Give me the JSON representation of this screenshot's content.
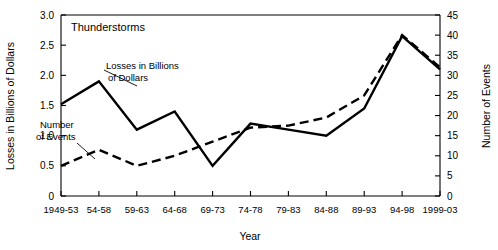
{
  "chart_data": {
    "type": "line",
    "title": "Thunderstorms",
    "xlabel": "Year",
    "ylabel": "Losses in Billions of Dollars",
    "y2label": "Number of Events",
    "categories": [
      "1949-53",
      "54-58",
      "59-63",
      "64-68",
      "69-73",
      "74-78",
      "79-83",
      "84-88",
      "89-93",
      "94-98",
      "1999-03"
    ],
    "ylim": [
      0,
      3.0
    ],
    "y2lim": [
      0,
      45
    ],
    "yticks": [
      "0",
      "0.5",
      "1.0",
      "1.5",
      "2.0",
      "2.5",
      "3.0"
    ],
    "ytick_values": [
      0,
      0.5,
      1.0,
      1.5,
      2.0,
      2.5,
      3.0
    ],
    "y2ticks": [
      "0",
      "5",
      "10",
      "15",
      "20",
      "25",
      "30",
      "35",
      "40",
      "45"
    ],
    "y2tick_values": [
      0,
      5,
      10,
      15,
      20,
      25,
      30,
      35,
      40,
      45
    ],
    "grid": false,
    "legend": "annotations",
    "series": [
      {
        "name": "Losses in Billions of Dollars",
        "axis": "left",
        "style": "solid",
        "values": [
          1.52,
          1.9,
          1.1,
          1.4,
          0.5,
          1.2,
          1.1,
          1.0,
          1.45,
          2.65,
          2.1
        ]
      },
      {
        "name": "Number of Events",
        "axis": "right",
        "style": "dashed",
        "values": [
          7.5,
          11.5,
          7.5,
          10.0,
          13.5,
          17.0,
          17.5,
          19.5,
          25.0,
          40.0,
          32.0
        ]
      }
    ],
    "annotations": [
      {
        "text_line1": "Losses in Billions",
        "text_line2": "of Dollars"
      },
      {
        "text_line1": "Number",
        "text_line2": "of Events"
      }
    ]
  }
}
